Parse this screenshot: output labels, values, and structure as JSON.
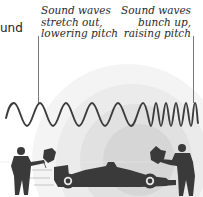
{
  "fragment_text": "und",
  "captions": {
    "left": {
      "lines": [
        "Sound waves",
        "stretch out,",
        "lowering pitch"
      ]
    },
    "right": {
      "lines": [
        "Sound waves",
        "bunch up,",
        "raising pitch"
      ]
    }
  },
  "colors": {
    "wave": "#3c3c3c",
    "silhouette": "#3a3a3a",
    "leader": "#555555",
    "circle_outer": "#f3f3f3",
    "circle_2": "#e9e9e9",
    "circle_3": "#dedede",
    "circle_inner": "#d2d2d2"
  },
  "icons": {
    "left_figure": "flag-waver-silhouette",
    "right_figure": "flag-waver-silhouette",
    "car": "race-car-silhouette"
  }
}
